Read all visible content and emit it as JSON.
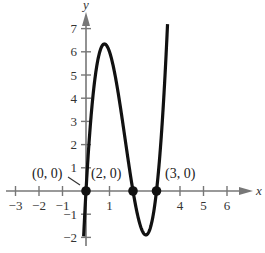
{
  "chart_data": {
    "type": "line",
    "title": "",
    "xlabel": "x",
    "ylabel": "y",
    "xlim": [
      -3.4,
      6.8
    ],
    "ylim": [
      -2.3,
      7.6
    ],
    "grid": false,
    "x_ticks": [
      -3,
      -2,
      -1,
      1,
      4,
      5,
      6
    ],
    "x_tick_labels": [
      "−3",
      "−2",
      "−1",
      "1",
      "4",
      "5",
      "6"
    ],
    "y_ticks": [
      -2,
      -1,
      1,
      2,
      3,
      4,
      5,
      6,
      7
    ],
    "y_tick_labels": [
      "−2",
      "−1",
      "1",
      "2",
      "3",
      "4",
      "5",
      "6",
      "7"
    ],
    "series": [
      {
        "name": "f(x) = 3x(x−2)(x−3)",
        "description": "Cubic curve with zeros at x = 0, 2, 3; local max ≈ 6.3 near x ≈ 0.8; local min ≈ −1.9 near x ≈ 2.5",
        "x": [
          -0.1,
          0,
          0.2,
          0.4,
          0.6,
          0.8,
          1.0,
          1.2,
          1.4,
          1.6,
          1.8,
          2.0,
          2.2,
          2.4,
          2.5,
          2.6,
          2.8,
          3.0,
          3.2,
          3.4,
          3.47
        ],
        "y": [
          -1.9,
          0,
          3.02,
          5.04,
          6.05,
          6.34,
          6.0,
          5.11,
          3.86,
          2.4,
          0.86,
          0,
          -1.06,
          -1.73,
          -1.88,
          -1.87,
          -1.34,
          0,
          2.3,
          5.71,
          7.2
        ]
      }
    ],
    "annotations": [
      {
        "label": "(0, 0)",
        "x": 0,
        "y": 0
      },
      {
        "label": "(2, 0)",
        "x": 2,
        "y": 0
      },
      {
        "label": "(3, 0)",
        "x": 3,
        "y": 0
      }
    ],
    "legend": "none"
  },
  "labels": {
    "x_axis": "x",
    "y_axis": "y",
    "points": [
      "(0, 0)",
      "(2, 0)",
      "(3, 0)"
    ]
  }
}
